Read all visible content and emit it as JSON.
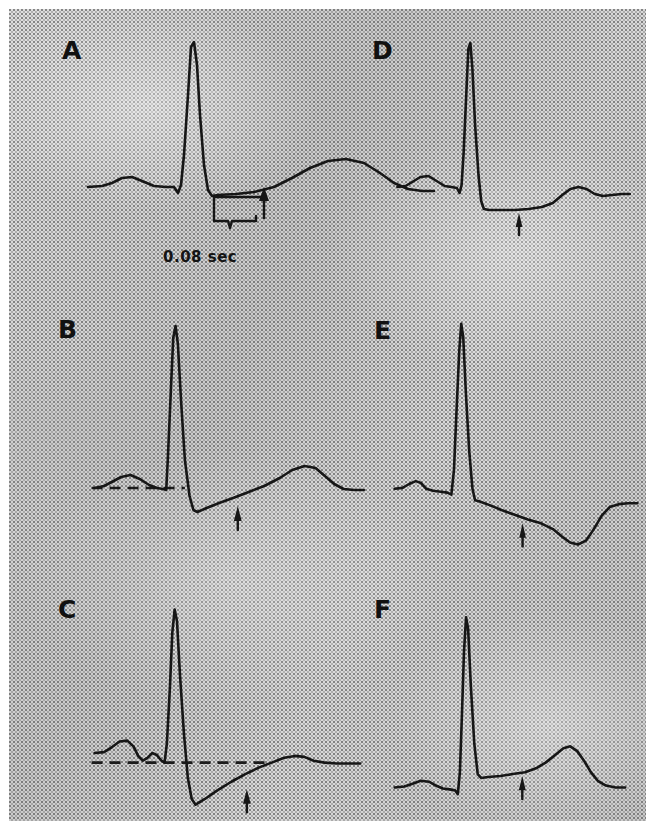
{
  "figure": {
    "kind": "ecg-st-segment-panels",
    "panel_count": 6,
    "background_color": "#c9c9c9",
    "trace_color": "#161616",
    "margin_color": "#ffffff"
  },
  "labels": {
    "a": "A",
    "b": "B",
    "c": "C",
    "d": "D",
    "e": "E",
    "f": "F"
  },
  "annotations": {
    "scale_caption": "0.08 sec"
  },
  "chart_data": {
    "type": "line",
    "title": "",
    "xlabel": "",
    "ylabel": "",
    "grid": false,
    "legend": null,
    "shared_notes": "Six single-beat ECG complexes illustrating normal and abnormal ST-segment responses. Arrow marks the ST measurement point 0.08 sec after the J point.",
    "panels": [
      {
        "id": "A",
        "label": "A",
        "description": "Normal ST segment; J point at baseline, upright T wave. Brace marks the 0.08 sec interval after the J point with an upward arrow at the measurement point.",
        "has_dashed_baseline": false,
        "has_measure_brace": true,
        "has_arrow": true,
        "caption": "0.08 sec",
        "points": [
          [
            10,
            152
          ],
          [
            24,
            151
          ],
          [
            34,
            148
          ],
          [
            44,
            143
          ],
          [
            54,
            142
          ],
          [
            64,
            146
          ],
          [
            76,
            151
          ],
          [
            88,
            152
          ],
          [
            96,
            152
          ],
          [
            100,
            158
          ],
          [
            103,
            150
          ],
          [
            106,
            120
          ],
          [
            110,
            60
          ],
          [
            113,
            12
          ],
          [
            116,
            7
          ],
          [
            119,
            30
          ],
          [
            122,
            80
          ],
          [
            126,
            130
          ],
          [
            130,
            155
          ],
          [
            134,
            161
          ],
          [
            140,
            160
          ],
          [
            158,
            159
          ],
          [
            176,
            157
          ],
          [
            196,
            152
          ],
          [
            214,
            143
          ],
          [
            232,
            133
          ],
          [
            250,
            126
          ],
          [
            268,
            124
          ],
          [
            286,
            128
          ],
          [
            302,
            138
          ],
          [
            316,
            148
          ],
          [
            330,
            154
          ],
          [
            344,
            156
          ],
          [
            356,
            156
          ]
        ],
        "baseline_y": 152,
        "j_point_x": 134,
        "measure_x": 186
      },
      {
        "id": "B",
        "label": "B",
        "description": "Horizontal ST-segment depression below the dashed baseline, arrow at 0.08 sec point.",
        "has_dashed_baseline": true,
        "has_measure_brace": false,
        "has_arrow": true,
        "caption": "",
        "points": [
          [
            6,
            168
          ],
          [
            18,
            166
          ],
          [
            28,
            162
          ],
          [
            40,
            157
          ],
          [
            52,
            155
          ],
          [
            64,
            159
          ],
          [
            76,
            165
          ],
          [
            86,
            168
          ],
          [
            94,
            169
          ],
          [
            98,
            170
          ],
          [
            100,
            140
          ],
          [
            104,
            70
          ],
          [
            107,
            18
          ],
          [
            110,
            6
          ],
          [
            113,
            24
          ],
          [
            117,
            80
          ],
          [
            122,
            140
          ],
          [
            128,
            176
          ],
          [
            133,
            190
          ],
          [
            138,
            192
          ],
          [
            150,
            188
          ],
          [
            166,
            183
          ],
          [
            184,
            178
          ],
          [
            204,
            172
          ],
          [
            224,
            166
          ],
          [
            244,
            158
          ],
          [
            260,
            150
          ],
          [
            276,
            146
          ],
          [
            290,
            148
          ],
          [
            302,
            156
          ],
          [
            314,
            164
          ],
          [
            326,
            169
          ],
          [
            340,
            170
          ],
          [
            352,
            170
          ]
        ],
        "baseline_y": 168,
        "dashed_from_x": 2,
        "dashed_to_x": 122,
        "measure_x": 190
      },
      {
        "id": "C",
        "label": "C",
        "description": "Upsloping (junctional) ST depression rising back toward the dashed baseline, arrow at 0.08 sec point.",
        "has_dashed_baseline": true,
        "has_measure_brace": false,
        "has_arrow": true,
        "caption": "",
        "points": [
          [
            6,
            160
          ],
          [
            18,
            159
          ],
          [
            28,
            154
          ],
          [
            38,
            148
          ],
          [
            48,
            147
          ],
          [
            56,
            153
          ],
          [
            62,
            163
          ],
          [
            68,
            168
          ],
          [
            74,
            165
          ],
          [
            80,
            160
          ],
          [
            86,
            162
          ],
          [
            92,
            168
          ],
          [
            96,
            170
          ],
          [
            99,
            150
          ],
          [
            103,
            90
          ],
          [
            106,
            34
          ],
          [
            109,
            10
          ],
          [
            112,
            22
          ],
          [
            116,
            80
          ],
          [
            121,
            140
          ],
          [
            126,
            186
          ],
          [
            131,
            208
          ],
          [
            136,
            214
          ],
          [
            148,
            208
          ],
          [
            164,
            199
          ],
          [
            182,
            190
          ],
          [
            200,
            182
          ],
          [
            218,
            175
          ],
          [
            234,
            170
          ],
          [
            250,
            165
          ],
          [
            264,
            163
          ],
          [
            276,
            164
          ],
          [
            288,
            168
          ],
          [
            302,
            170
          ],
          [
            318,
            171
          ],
          [
            334,
            171
          ],
          [
            348,
            171
          ]
        ],
        "baseline_y": 170,
        "dashed_from_x": 2,
        "dashed_to_x": 232,
        "measure_x": 202
      },
      {
        "id": "D",
        "label": "D",
        "description": "Horizontal ST-segment depression after the J point, low flat T wave; arrow marks the 0.08 sec measurement point.",
        "has_dashed_baseline": false,
        "has_measure_brace": false,
        "has_arrow": true,
        "caption": "",
        "points": [
          [
            8,
            152
          ],
          [
            20,
            151
          ],
          [
            30,
            147
          ],
          [
            42,
            142
          ],
          [
            54,
            141
          ],
          [
            66,
            146
          ],
          [
            78,
            151
          ],
          [
            88,
            152
          ],
          [
            96,
            153
          ],
          [
            100,
            158
          ],
          [
            103,
            150
          ],
          [
            106,
            118
          ],
          [
            110,
            58
          ],
          [
            113,
            14
          ],
          [
            116,
            8
          ],
          [
            119,
            34
          ],
          [
            123,
            90
          ],
          [
            128,
            140
          ],
          [
            132,
            166
          ],
          [
            136,
            174
          ],
          [
            144,
            175
          ],
          [
            162,
            175
          ],
          [
            182,
            175
          ],
          [
            202,
            174
          ],
          [
            222,
            172
          ],
          [
            238,
            168
          ],
          [
            252,
            160
          ],
          [
            264,
            154
          ],
          [
            276,
            152
          ],
          [
            288,
            154
          ],
          [
            300,
            159
          ],
          [
            312,
            161
          ],
          [
            326,
            160
          ],
          [
            340,
            159
          ],
          [
            352,
            159
          ]
        ],
        "baseline_y": 152,
        "j_point_x": 136,
        "measure_x": 188
      },
      {
        "id": "E",
        "label": "E",
        "description": "Downsloping ST-segment depression with inverted T wave; arrow at the 0.08 sec measurement point.",
        "has_dashed_baseline": false,
        "has_measure_brace": false,
        "has_arrow": true,
        "caption": "",
        "points": [
          [
            4,
            180
          ],
          [
            16,
            179
          ],
          [
            26,
            175
          ],
          [
            36,
            172
          ],
          [
            44,
            174
          ],
          [
            52,
            180
          ],
          [
            62,
            182
          ],
          [
            74,
            183
          ],
          [
            84,
            184
          ],
          [
            90,
            186
          ],
          [
            94,
            160
          ],
          [
            98,
            96
          ],
          [
            102,
            36
          ],
          [
            105,
            8
          ],
          [
            108,
            22
          ],
          [
            112,
            80
          ],
          [
            117,
            140
          ],
          [
            122,
            180
          ],
          [
            126,
            192
          ],
          [
            132,
            193
          ],
          [
            148,
            197
          ],
          [
            166,
            202
          ],
          [
            186,
            207
          ],
          [
            206,
            212
          ],
          [
            226,
            216
          ],
          [
            244,
            222
          ],
          [
            258,
            230
          ],
          [
            270,
            236
          ],
          [
            282,
            238
          ],
          [
            294,
            234
          ],
          [
            306,
            222
          ],
          [
            318,
            208
          ],
          [
            330,
            199
          ],
          [
            344,
            196
          ],
          [
            358,
            195
          ],
          [
            372,
            195
          ]
        ],
        "baseline_y": 184,
        "j_point_x": 130,
        "measure_x": 198
      },
      {
        "id": "F",
        "label": "F",
        "description": "ST-segment elevation above the baseline with a tall upright T wave; arrow at the 0.08 sec measurement point.",
        "has_dashed_baseline": false,
        "has_measure_brace": false,
        "has_arrow": true,
        "caption": "",
        "points": [
          [
            4,
            196
          ],
          [
            18,
            195
          ],
          [
            30,
            192
          ],
          [
            42,
            189
          ],
          [
            54,
            190
          ],
          [
            64,
            194
          ],
          [
            74,
            197
          ],
          [
            84,
            198
          ],
          [
            92,
            199
          ],
          [
            96,
            203
          ],
          [
            99,
            180
          ],
          [
            102,
            120
          ],
          [
            105,
            54
          ],
          [
            108,
            18
          ],
          [
            111,
            30
          ],
          [
            115,
            90
          ],
          [
            120,
            150
          ],
          [
            125,
            182
          ],
          [
            130,
            186
          ],
          [
            140,
            185
          ],
          [
            158,
            184
          ],
          [
            176,
            182
          ],
          [
            194,
            180
          ],
          [
            210,
            176
          ],
          [
            224,
            170
          ],
          [
            238,
            162
          ],
          [
            250,
            155
          ],
          [
            260,
            153
          ],
          [
            270,
            158
          ],
          [
            280,
            168
          ],
          [
            290,
            180
          ],
          [
            300,
            189
          ],
          [
            312,
            194
          ],
          [
            326,
            196
          ],
          [
            340,
            196
          ]
        ],
        "baseline_y": 197,
        "j_point_x": 128,
        "measure_x": 190
      }
    ]
  }
}
